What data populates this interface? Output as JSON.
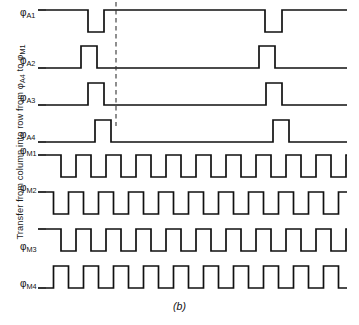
{
  "figure": {
    "caption": "(b)",
    "axis_label": {
      "prefix": "Transfer from column into row from ",
      "signal_a": "A4",
      "middle": " to ",
      "signal_m": "M1",
      "full_text": "Transfer from column into row from φA4 to φM1"
    },
    "marker": {
      "name": "transfer-instant-dashed-line",
      "x": 116,
      "y_top": 2,
      "y_bottom": 126,
      "style": "dashed"
    },
    "geometry": {
      "plot_left": 46,
      "plot_right": 347,
      "stroke_color": "#111111",
      "background": "#ffffff"
    }
  },
  "chart_data": {
    "type": "line",
    "title": "",
    "subtitle": "",
    "xlabel": "",
    "ylabel": "Transfer from column into row from φA4 to φM1",
    "grid": false,
    "legend": "none",
    "x_range": [
      46,
      347
    ],
    "signals": [
      {
        "name": "φA1",
        "base": "A",
        "index": 1,
        "label_sub": "A1",
        "idle_level": "high",
        "baseline_y": 10,
        "high_y": 10,
        "low_y": 32,
        "label_y": 14,
        "pulses": [
          {
            "type": "low",
            "start": 88,
            "end": 104
          },
          {
            "type": "low",
            "start": 265,
            "end": 282
          }
        ]
      },
      {
        "name": "φA2",
        "base": "A",
        "index": 2,
        "label_sub": "A2",
        "idle_level": "low",
        "baseline_y": 68,
        "high_y": 46,
        "low_y": 68,
        "label_y": 62,
        "pulses": [
          {
            "type": "high",
            "start": 81,
            "end": 97
          },
          {
            "type": "high",
            "start": 259,
            "end": 275
          }
        ]
      },
      {
        "name": "φA3",
        "base": "A",
        "index": 3,
        "label_sub": "A3",
        "idle_level": "low",
        "baseline_y": 105,
        "high_y": 83,
        "low_y": 105,
        "label_y": 99,
        "pulses": [
          {
            "type": "high",
            "start": 88,
            "end": 104
          },
          {
            "type": "high",
            "start": 266,
            "end": 282
          }
        ]
      },
      {
        "name": "φA4",
        "base": "A",
        "index": 4,
        "label_sub": "A4",
        "idle_level": "low",
        "baseline_y": 142,
        "high_y": 120,
        "low_y": 142,
        "label_y": 136,
        "pulses": [
          {
            "type": "high",
            "start": 95,
            "end": 111
          },
          {
            "type": "high",
            "start": 273,
            "end": 289
          }
        ]
      },
      {
        "name": "φM1",
        "base": "M",
        "index": 1,
        "label_sub": "M1",
        "type": "square",
        "start_level": "high",
        "high_y": 155,
        "low_y": 177,
        "label_y": 152,
        "period": 30,
        "half_period": 15,
        "phase_offset": 0,
        "cycles": 10
      },
      {
        "name": "φM2",
        "base": "M",
        "index": 2,
        "label_sub": "M2",
        "type": "square",
        "start_level": "high",
        "high_y": 192,
        "low_y": 214,
        "label_y": 189,
        "period": 30,
        "half_period": 15,
        "phase_offset": 7.5,
        "cycles": 10
      },
      {
        "name": "φM3",
        "base": "M",
        "index": 3,
        "label_sub": "M3",
        "type": "square",
        "start_level": "high",
        "high_y": 229,
        "low_y": 251,
        "label_y": 248,
        "period": 30,
        "half_period": 15,
        "phase_offset": 15,
        "cycles": 10
      },
      {
        "name": "φM4",
        "base": "M",
        "index": 4,
        "label_sub": "M4",
        "type": "square",
        "start_level": "low",
        "high_y": 266,
        "low_y": 288,
        "label_y": 285,
        "period": 30,
        "half_period": 15,
        "phase_offset": 22.5,
        "cycles": 10
      }
    ]
  }
}
